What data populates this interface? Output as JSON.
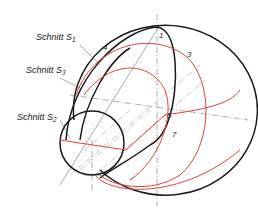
{
  "diagram": {
    "labels": {
      "schnitt_s1": {
        "text": "Schnitt S",
        "sub": "1"
      },
      "schnitt_s3": {
        "text": "Schnitt S",
        "sub": "3"
      },
      "schnitt_s2": {
        "text": "Schnitt S",
        "sub": "2"
      }
    },
    "points": [
      "1",
      "3",
      "4",
      "5",
      "7"
    ],
    "colors": {
      "outline": "#1a1a1a",
      "section": "#e0403a",
      "construction": "#777777"
    }
  }
}
